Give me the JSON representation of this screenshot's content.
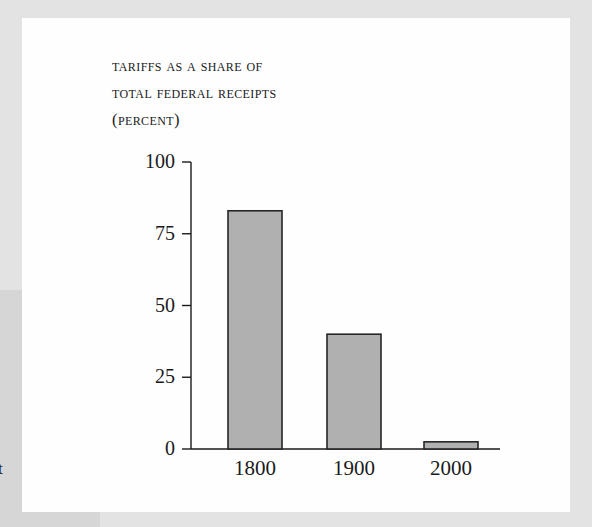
{
  "page": {
    "clipped_body_text": "t"
  },
  "figure": {
    "title_lines": [
      "Tariffs as a share of",
      "total federal receipts",
      "(percent)"
    ]
  },
  "colors": {
    "bar_fill": "#b0b0b0",
    "bar_stroke": "#262626",
    "axis": "#1a1a1a",
    "text": "#1a1a1a",
    "panel_bg": "#fefefe",
    "page_band": "#e3e3e3",
    "left_block": "#d6d6d6"
  },
  "chart_data": {
    "type": "bar",
    "title": "Tariffs as a share of total federal receipts (percent)",
    "xlabel": "",
    "ylabel": "",
    "categories": [
      "1800",
      "1900",
      "2000"
    ],
    "values": [
      83,
      40,
      2.5
    ],
    "ylim": [
      0,
      100
    ],
    "yticks": [
      0,
      25,
      50,
      75,
      100
    ],
    "ytick_labels": [
      "0",
      "25",
      "50",
      "75",
      "100"
    ],
    "xtick_labels": [
      "1800",
      "1900",
      "2000"
    ],
    "grid": false,
    "legend": null,
    "tick_direction": "out",
    "spines": [
      "left",
      "bottom"
    ]
  }
}
